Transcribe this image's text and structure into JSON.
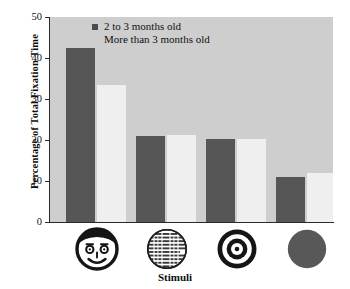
{
  "chart_data": {
    "type": "bar",
    "title": "",
    "xlabel": "Stimuli",
    "ylabel": "Percentage of Total Fixation Time",
    "ylim": [
      0,
      50
    ],
    "yticks": [
      0,
      10,
      20,
      30,
      40,
      50
    ],
    "grid": false,
    "legend_position": "top-center",
    "categories": [
      "face",
      "newsprint",
      "bullseye",
      "plain-circle"
    ],
    "category_labels": [
      "Face",
      "Newsprint",
      "Bullseye",
      "Plain circle"
    ],
    "series": [
      {
        "name": "2 to 3 months old",
        "color": "#565656",
        "values": [
          42.5,
          21.0,
          20.2,
          11.0
        ]
      },
      {
        "name": "More than 3 months old",
        "color": "#efefef",
        "values": [
          33.5,
          21.3,
          20.3,
          12.0
        ]
      }
    ]
  },
  "axes": {
    "ylabel": "Percentage of Total Fixation Time",
    "xlabel": "Stimuli",
    "ytick_labels": [
      "50",
      "40",
      "30",
      "20",
      "10",
      "0"
    ]
  },
  "legend": {
    "entries": [
      {
        "label": "2 to 3 months old",
        "swatch": "dark"
      },
      {
        "label": "More than 3 months old",
        "swatch": "light"
      }
    ]
  },
  "stimuli": [
    {
      "name": "smiling-face-icon"
    },
    {
      "name": "newsprint-circle-icon"
    },
    {
      "name": "bullseye-target-icon"
    },
    {
      "name": "solid-circle-icon"
    }
  ],
  "colors": {
    "plot_background": "#cecece",
    "series_dark": "#565656",
    "series_light": "#efefef",
    "axis": "#2a2a2a",
    "text": "#111111"
  }
}
